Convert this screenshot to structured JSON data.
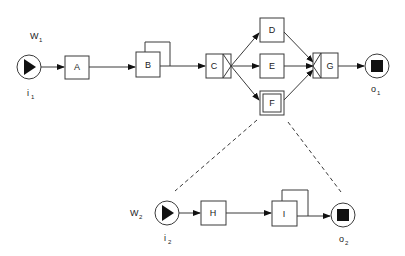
{
  "diagram": {
    "type": "workflow-net",
    "workflows": [
      {
        "name": "W",
        "name_sub": "1",
        "input": {
          "label": "i",
          "sub": "1"
        },
        "output": {
          "label": "o",
          "sub": "1"
        },
        "tasks": [
          "A",
          "B",
          "C",
          "D",
          "E",
          "F",
          "G"
        ]
      },
      {
        "name": "W",
        "name_sub": "2",
        "input": {
          "label": "i",
          "sub": "2"
        },
        "output": {
          "label": "o",
          "sub": "2"
        },
        "tasks": [
          "H",
          "I"
        ]
      }
    ],
    "labels": {
      "A": "A",
      "B": "B",
      "C": "C",
      "D": "D",
      "E": "E",
      "F": "F",
      "G": "G",
      "H": "H",
      "I": "I"
    },
    "edges": [
      [
        "i1",
        "A"
      ],
      [
        "A",
        "B"
      ],
      [
        "B",
        "B"
      ],
      [
        "B",
        "C"
      ],
      [
        "C",
        "D"
      ],
      [
        "C",
        "E"
      ],
      [
        "C",
        "F"
      ],
      [
        "D",
        "G"
      ],
      [
        "E",
        "G"
      ],
      [
        "F",
        "G"
      ],
      [
        "G",
        "o1"
      ],
      [
        "i2",
        "H"
      ],
      [
        "H",
        "I"
      ],
      [
        "I",
        "I"
      ],
      [
        "I",
        "o2"
      ]
    ],
    "notes": {
      "C": "XOR-split",
      "G": "XOR-join",
      "F": "composite task refined by W2"
    }
  }
}
